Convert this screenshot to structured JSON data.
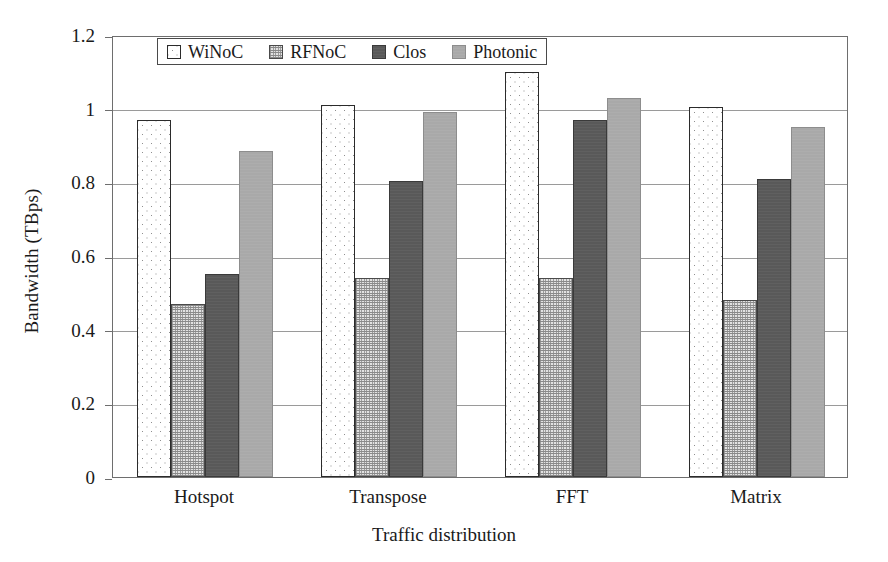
{
  "chart_data": {
    "type": "bar",
    "title": "",
    "xlabel": "Traffic distribution",
    "ylabel": "Bandwidth (TBps)",
    "categories": [
      "Hotspot",
      "Transpose",
      "FFT",
      "Matrix"
    ],
    "series": [
      {
        "name": "WiNoC",
        "values": [
          0.97,
          1.01,
          1.1,
          1.005
        ],
        "color": "#ffffff",
        "pattern": "sparse-dots",
        "border": "#2b2b2b"
      },
      {
        "name": "RFNoC",
        "values": [
          0.47,
          0.54,
          0.54,
          0.48
        ],
        "color": "#e2e2e2",
        "pattern": "fine-stipple",
        "border": "#4a4a4a"
      },
      {
        "name": "Clos",
        "values": [
          0.55,
          0.805,
          0.97,
          0.81
        ],
        "color": "#595959",
        "pattern": "solid-dark",
        "border": "#3a3a3a"
      },
      {
        "name": "Photonic",
        "values": [
          0.885,
          0.99,
          1.03,
          0.95
        ],
        "color": "#a9a9a9",
        "pattern": "solid-medium",
        "border": "#8d8d8d"
      }
    ],
    "ylim": [
      0,
      1.2
    ],
    "yticks": [
      0,
      0.2,
      0.4,
      0.6,
      0.8,
      1,
      1.2
    ],
    "ytick_labels": [
      "0",
      "0.2",
      "0.4",
      "0.6",
      "0.8",
      "1",
      "1.2"
    ],
    "grid": "horizontal",
    "legend_position": "top-left-inside",
    "axis_color": "#6e6e6e",
    "grid_color": "#9a9a9a"
  }
}
